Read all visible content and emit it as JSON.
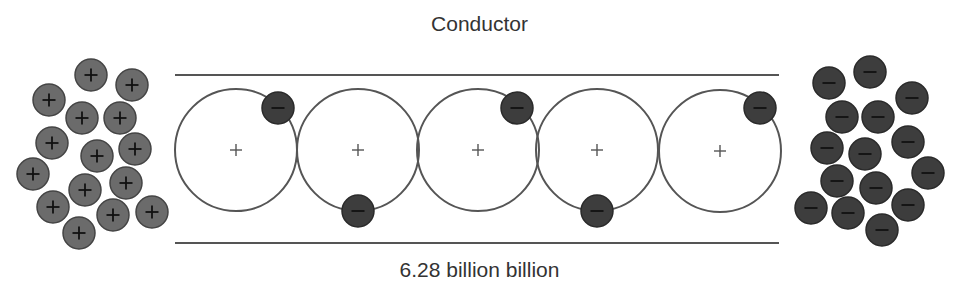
{
  "title": "Conductor",
  "bottom_label": "6.28 billion billion",
  "colors": {
    "background": "#ffffff",
    "line": "#555555",
    "atom_outline": "#555555",
    "proton_fill": "#6b6b6b",
    "proton_stroke": "#444444",
    "electron_fill": "#3d3d3d",
    "electron_stroke": "#2a2a2a",
    "symbol": "#111111",
    "nucleus_symbol": "#555555"
  },
  "conductor": {
    "x1": 175,
    "x2": 779,
    "top_y": 75,
    "bottom_y": 243
  },
  "atoms": [
    {
      "cx": 236,
      "cy": 150,
      "r": 61,
      "nucleus": "+",
      "electron": {
        "cx": 278,
        "cy": 108
      }
    },
    {
      "cx": 358,
      "cy": 150,
      "r": 61,
      "nucleus": "+",
      "electron": {
        "cx": 358,
        "cy": 211
      }
    },
    {
      "cx": 478,
      "cy": 150,
      "r": 61,
      "nucleus": "+",
      "electron": {
        "cx": 517,
        "cy": 108
      }
    },
    {
      "cx": 597,
      "cy": 150,
      "r": 61,
      "nucleus": "+",
      "electron": {
        "cx": 597,
        "cy": 211
      }
    },
    {
      "cx": 720,
      "cy": 151,
      "r": 61,
      "nucleus": "+",
      "electron": {
        "cx": 760,
        "cy": 108
      }
    }
  ],
  "charge_radius": 16,
  "positive_cluster": {
    "symbol": "+",
    "charges": [
      [
        91,
        75
      ],
      [
        132,
        85
      ],
      [
        49,
        100
      ],
      [
        82,
        118
      ],
      [
        120,
        118
      ],
      [
        52,
        143
      ],
      [
        97,
        156
      ],
      [
        135,
        149
      ],
      [
        33,
        174
      ],
      [
        85,
        190
      ],
      [
        126,
        183
      ],
      [
        53,
        207
      ],
      [
        113,
        215
      ],
      [
        152,
        212
      ],
      [
        79,
        233
      ]
    ]
  },
  "negative_cluster": {
    "symbol": "−",
    "charges": [
      [
        829,
        83
      ],
      [
        870,
        72
      ],
      [
        912,
        98
      ],
      [
        842,
        117
      ],
      [
        878,
        117
      ],
      [
        827,
        148
      ],
      [
        865,
        154
      ],
      [
        908,
        142
      ],
      [
        928,
        173
      ],
      [
        837,
        181
      ],
      [
        876,
        188
      ],
      [
        811,
        208
      ],
      [
        848,
        213
      ],
      [
        908,
        205
      ],
      [
        882,
        230
      ]
    ]
  }
}
